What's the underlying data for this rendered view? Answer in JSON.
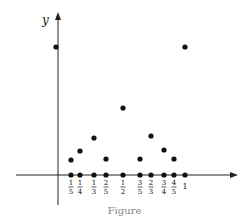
{
  "chart_data": {
    "type": "scatter",
    "title": "",
    "xlabel": "",
    "ylabel": "y",
    "caption": "Figure",
    "grid": false,
    "legend": null,
    "xlim": [
      0,
      1
    ],
    "ylim": [
      0,
      1
    ],
    "tick_labels": [
      "1/5",
      "1/4",
      "1/3",
      "2/5",
      "1/2",
      "3/5",
      "2/3",
      "3/4",
      "4/5",
      "1"
    ],
    "series": [
      {
        "name": "f(x) (function value points)",
        "points": [
          {
            "x": 0,
            "y": 1
          },
          {
            "x": 0.2,
            "y": 0.2
          },
          {
            "x": 0.25,
            "y": 0.25
          },
          {
            "x": 0.3333,
            "y": 0.3333
          },
          {
            "x": 0.4,
            "y": 0.2
          },
          {
            "x": 0.5,
            "y": 0.5
          },
          {
            "x": 0.6,
            "y": 0.2
          },
          {
            "x": 0.6667,
            "y": 0.3333
          },
          {
            "x": 0.75,
            "y": 0.25
          },
          {
            "x": 0.8,
            "y": 0.2
          },
          {
            "x": 1,
            "y": 1
          }
        ]
      },
      {
        "name": "points on x-axis",
        "points": [
          {
            "x": 0.2,
            "y": 0
          },
          {
            "x": 0.25,
            "y": 0
          },
          {
            "x": 0.3333,
            "y": 0
          },
          {
            "x": 0.4,
            "y": 0
          },
          {
            "x": 0.5,
            "y": 0
          },
          {
            "x": 0.6,
            "y": 0
          },
          {
            "x": 0.6667,
            "y": 0
          },
          {
            "x": 0.75,
            "y": 0
          },
          {
            "x": 0.8,
            "y": 0
          },
          {
            "x": 1,
            "y": 0
          }
        ]
      }
    ],
    "render": {
      "origin_px": [
        58,
        175
      ],
      "x_axis": {
        "x1": 16,
        "x2": 238,
        "y": 175
      },
      "y_axis": {
        "x": 58,
        "y1": 205,
        "y2": 12
      },
      "tick_px": [
        71,
        80,
        94,
        106,
        123,
        140,
        151,
        164,
        174,
        185
      ],
      "value_px": [
        {
          "x": 56,
          "y": 47
        },
        {
          "x": 71,
          "y": 160
        },
        {
          "x": 80,
          "y": 151
        },
        {
          "x": 94,
          "y": 138
        },
        {
          "x": 106,
          "y": 159
        },
        {
          "x": 123,
          "y": 108
        },
        {
          "x": 140,
          "y": 159
        },
        {
          "x": 151,
          "y": 136
        },
        {
          "x": 164,
          "y": 150
        },
        {
          "x": 174,
          "y": 159
        },
        {
          "x": 185,
          "y": 47
        }
      ]
    }
  }
}
